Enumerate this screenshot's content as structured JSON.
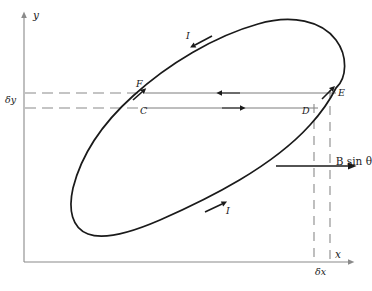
{
  "figure": {
    "background_color": "#ffffff",
    "stroke_color": "#1a1a1a",
    "axis_color": "#8a8a8a",
    "guide_color": "#9a9a9a",
    "width": 372,
    "height": 291
  },
  "axes": {
    "y_label": "y",
    "x_label": "x",
    "y_axis": {
      "x": 24,
      "y_top": 14,
      "y_bottom": 262
    },
    "x_axis": {
      "y": 262,
      "x_left": 24,
      "x_right": 352
    }
  },
  "annotations": {
    "delta_y": "δy",
    "delta_x": "δx",
    "force_label_prefix": "B",
    "force_label_mid": "sin",
    "force_label_suffix": "θ",
    "force_label_full": "B sin θ"
  },
  "points": [
    {
      "id": "F",
      "label": "F",
      "x": 140,
      "y": 86,
      "note": "curve crossing upper guide line"
    },
    {
      "id": "C",
      "label": "C",
      "x": 143,
      "y": 101,
      "note": "curve crossing lower guide line"
    },
    {
      "id": "D",
      "label": "D",
      "x": 305,
      "y": 101,
      "note": "right end lower guide line"
    },
    {
      "id": "E",
      "label": "E",
      "x": 338,
      "y": 86,
      "note": "right end upper guide line"
    },
    {
      "id": "I-top",
      "label": "I",
      "x": 188,
      "y": 36,
      "note": "current arrow upper branch"
    },
    {
      "id": "I-bottom",
      "label": "I",
      "x": 228,
      "y": 211,
      "note": "current arrow lower branch"
    }
  ],
  "guide_lines": {
    "upper_y": 93,
    "lower_y": 108,
    "dash_segment_end_x": 146,
    "solid_segment_end_x": 336,
    "vertical_dash_x1": 314,
    "vertical_dash_x2": 330
  },
  "arrows": {
    "upper_guide_direction": "left",
    "lower_guide_direction": "right",
    "force_direction": "right",
    "force_line_y": 166,
    "force_line_x_start": 276,
    "force_line_x_end": 352
  },
  "curve": {
    "type": "closed-loop",
    "description": "tilted elongated current loop crossing guide lines at F/C and D/E"
  }
}
